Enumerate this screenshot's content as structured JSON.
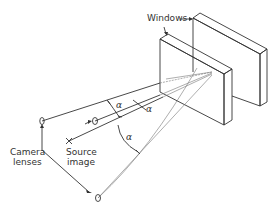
{
  "labels": {
    "windows": "Windows",
    "camera_line1": "Camera",
    "camera_line2": "lenses",
    "source_line1": "Source",
    "source_line2": "image",
    "alpha_1": "α",
    "alpha_2": "α",
    "alpha_3": "α"
  },
  "colors": {
    "line": "#333333",
    "ray": "#777777",
    "background": "#ffffff"
  }
}
